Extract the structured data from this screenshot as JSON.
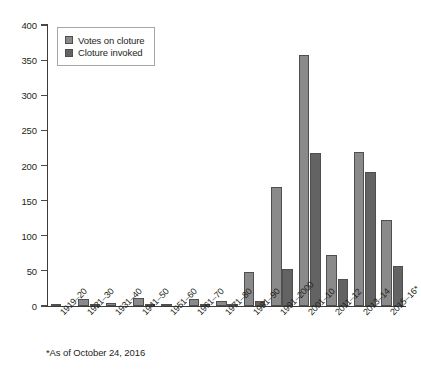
{
  "chart_data": {
    "type": "bar",
    "title": "",
    "subtitle": "",
    "xlabel": "",
    "ylabel": "",
    "ylim": [
      0,
      400
    ],
    "ytick_step": 50,
    "yticks": [
      0,
      50,
      100,
      150,
      200,
      250,
      300,
      350,
      400
    ],
    "grid": false,
    "legend_position": "top-left",
    "categories": [
      "1919–20",
      "1921–30",
      "1931–40",
      "1941–50",
      "1951–60",
      "1961–70",
      "1971–80",
      "1981–90",
      "1991–2000",
      "2001–10",
      "2011–12",
      "2013–14",
      "2015–16*"
    ],
    "series": [
      {
        "name": "Votes on cloture",
        "color": "#8a8a8a",
        "values": [
          2,
          10,
          4,
          12,
          2,
          10,
          7,
          48,
          170,
          357,
          73,
          219,
          122
        ]
      },
      {
        "name": "Cloture invoked",
        "color": "#636363",
        "values": [
          0,
          1,
          0,
          1,
          0,
          1,
          1,
          7,
          52,
          218,
          38,
          191,
          57
        ]
      }
    ],
    "annotations": [
      "*As of October 24, 2016"
    ]
  },
  "legend": {
    "items": [
      {
        "label": "Votes on cloture",
        "swatch": "votes"
      },
      {
        "label": "Cloture invoked",
        "swatch": "invoked"
      }
    ]
  },
  "footnote": {
    "text": "*As of October 24, 2016"
  }
}
